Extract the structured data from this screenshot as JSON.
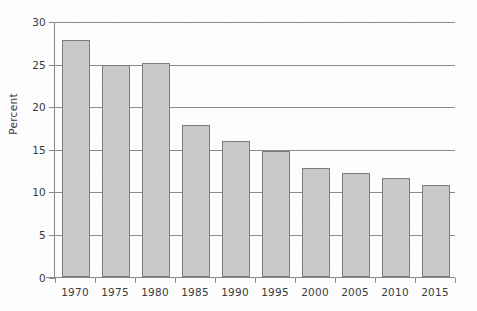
{
  "chart_data": {
    "type": "bar",
    "title": "",
    "subtitle": "",
    "xlabel": "",
    "ylabel": "Percent",
    "categories": [
      "1970",
      "1975",
      "1980",
      "1985",
      "1990",
      "1995",
      "2000",
      "2005",
      "2010",
      "2015"
    ],
    "values": [
      27.9,
      25.0,
      25.2,
      17.9,
      16.0,
      14.8,
      12.9,
      12.3,
      11.7,
      10.9
    ],
    "ylim": [
      0,
      30
    ],
    "ytick_labels": [
      "0",
      "5",
      "10",
      "15",
      "20",
      "25",
      "30"
    ],
    "ytick_values": [
      0,
      5,
      10,
      15,
      20,
      25,
      30
    ],
    "grid": "horizontal",
    "legend": "none",
    "bar_fill_color": "#c9c9c9",
    "bar_border_color": "#7d7d7d",
    "axis_color": "#8a8a8a",
    "text_color": "#3b3b3b",
    "background_color": "#fdfdfd"
  }
}
